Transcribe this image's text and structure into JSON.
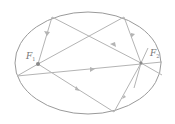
{
  "diagram": {
    "type": "ellipse-reflection",
    "labels": {
      "focus1": "F",
      "focus1_sub": "1",
      "focus2": "F",
      "focus2_sub": "2"
    },
    "colors": {
      "ellipse": "#9a9a9a",
      "rays": "#b4b4b4",
      "focus": "#8a8a8a",
      "label": "#777777"
    },
    "ellipse": {
      "cx": 88,
      "cy": 63,
      "rx": 73,
      "ry": 51
    },
    "foci": [
      {
        "name": "F1",
        "x": 38,
        "y": 64
      },
      {
        "name": "F2",
        "x": 141,
        "y": 63
      }
    ],
    "rays": [
      {
        "from": [
          38,
          64
        ],
        "to": [
          52,
          17
        ]
      },
      {
        "from": [
          52,
          17
        ],
        "to": [
          141,
          63
        ]
      },
      {
        "from": [
          38,
          64
        ],
        "to": [
          124,
          17
        ]
      },
      {
        "from": [
          124,
          17
        ],
        "to": [
          141,
          63
        ]
      },
      {
        "from": [
          38,
          64
        ],
        "to": [
          114,
          112
        ]
      },
      {
        "from": [
          114,
          112
        ],
        "to": [
          141,
          63
        ]
      },
      {
        "from": [
          17,
          76
        ],
        "to": [
          162,
          62
        ]
      },
      {
        "from": [
          17,
          76
        ],
        "to": [
          38,
          64
        ]
      },
      {
        "from": [
          141,
          63
        ],
        "to": [
          162,
          75
        ]
      },
      {
        "from": [
          141,
          63
        ],
        "to": [
          148,
          48
        ]
      },
      {
        "from": [
          141,
          63
        ],
        "to": [
          134,
          90
        ]
      }
    ]
  }
}
